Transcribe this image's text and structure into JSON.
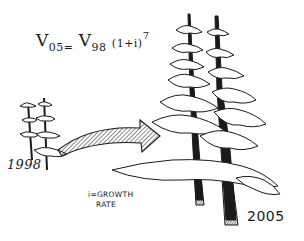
{
  "formula": {
    "lhs_var": "V",
    "lhs_sub": "05",
    "equals": "=",
    "rhs_var": "V",
    "rhs_sub": "98",
    "paren": "(1+i)",
    "exponent": "7"
  },
  "labels": {
    "start_year": "1998",
    "end_year": "2005",
    "legend_line1": "i=GROWTH",
    "legend_line2": "RATE"
  },
  "illustration": {
    "small_trees": "two-young-trees-1998",
    "large_trees": "two-mature-trees-2005",
    "arrow": "hatched-growth-arrow",
    "ink_color": "#1a1a1a",
    "background": "#ffffff"
  }
}
